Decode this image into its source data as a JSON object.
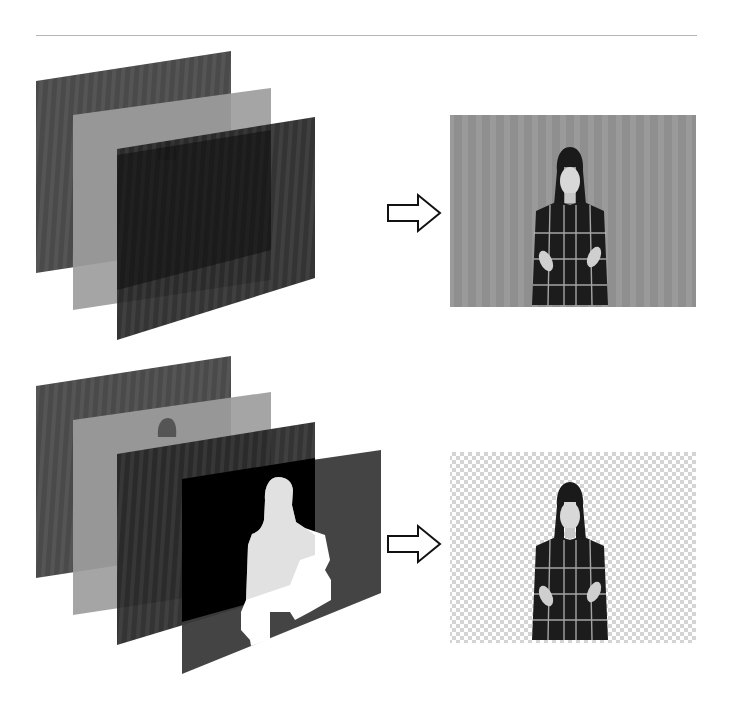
{
  "figure": {
    "rows": [
      {
        "id": "composite-row",
        "layers": [
          {
            "name": "layer-1",
            "tone": "dark-striped",
            "fill": "#4a4a4a"
          },
          {
            "name": "layer-2",
            "tone": "light-gray",
            "fill": "#9a9a9a"
          },
          {
            "name": "layer-3",
            "tone": "dark",
            "fill": "#1e1e1e"
          }
        ],
        "arrow": "right-arrow-outline",
        "result": {
          "name": "composite-frame",
          "background": "gray-striped",
          "background_color": "#8f8f8f"
        }
      },
      {
        "id": "matte-row",
        "layers": [
          {
            "name": "layer-1",
            "tone": "dark-striped",
            "fill": "#4a4a4a"
          },
          {
            "name": "layer-2",
            "tone": "light-gray",
            "fill": "#9a9a9a"
          },
          {
            "name": "layer-3",
            "tone": "dark",
            "fill": "#1e1e1e"
          },
          {
            "name": "alpha-matte",
            "tone": "silhouette-matte",
            "fill": "#3a3a3a",
            "silhouette": "#ffffff"
          }
        ],
        "arrow": "right-arrow-outline",
        "result": {
          "name": "keyed-frame",
          "background": "transparency-checkerboard",
          "checker_light": "#ffffff",
          "checker_dark": "#d4d4d4"
        }
      }
    ]
  }
}
